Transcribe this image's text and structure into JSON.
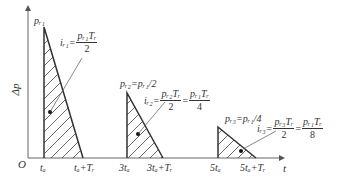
{
  "diagram": {
    "axes": {
      "y_label": "Δp",
      "x_label": "t",
      "origin_label": "O"
    },
    "x_ticks": [
      "t_a",
      "t_a+T_r",
      "3t_a",
      "3t_a+T_r",
      "5t_a",
      "5t_a+T_r"
    ],
    "x_tick_display": [
      "tₐ",
      "tₐ+Tᵣ",
      "3tₐ",
      "3tₐ+Tᵣ",
      "5tₐ",
      "5tₐ+Tᵣ"
    ],
    "pulses": [
      {
        "peak_label": "pr1",
        "peak_display": "pᵣ₁",
        "impulse_lhs": "iᵣ₁=",
        "impulse_num": "pᵣ₁Tᵣ",
        "impulse_den": "2",
        "impulse_extra": ""
      },
      {
        "peak_label": "pr2=pr1/2",
        "peak_display": "pᵣ₂=pᵣ₁/2",
        "impulse_lhs": "iᵣ₂=",
        "impulse_num": "pᵣ₂Tᵣ",
        "impulse_den": "2",
        "impulse_eq2_num": "pᵣ₁Tᵣ",
        "impulse_eq2_den": "4"
      },
      {
        "peak_label": "pr3=pr1/4",
        "peak_display": "pᵣ₃=pᵣ₁/4",
        "impulse_lhs": "iᵣ₃=",
        "impulse_num": "pᵣ₃Tᵣ",
        "impulse_den": "2",
        "impulse_eq2_num": "pᵣ₁Tᵣ",
        "impulse_eq2_den": "8"
      }
    ],
    "colors": {
      "line": "#333333",
      "axis": "#555555",
      "hatch": "#444444"
    }
  }
}
